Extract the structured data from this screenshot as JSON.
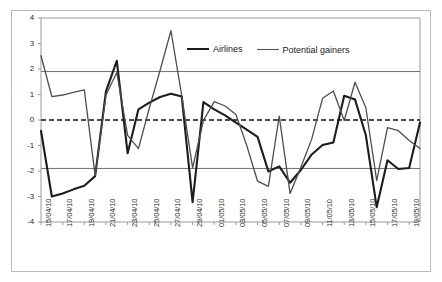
{
  "chart_data": {
    "type": "line",
    "title": "",
    "xlabel": "",
    "ylabel": "",
    "ylim": [
      -4,
      4
    ],
    "yticks": [
      4,
      3,
      2,
      1,
      0,
      -1,
      -2,
      -3,
      -4
    ],
    "grid": "horizontal gridlines at y = 1.9 and y = -1.9 plus frame top at 4; dashed zero reference line at y = 0",
    "gridlines": [
      1.9,
      -1.9
    ],
    "zero_line": 0,
    "legend_position": "top-center",
    "x": [
      "15/04/10",
      "16/04/10",
      "17/04/10",
      "18/04/10",
      "19/04/10",
      "20/04/10",
      "21/04/10",
      "22/04/10",
      "23/04/10",
      "24/04/10",
      "25/04/10",
      "26/04/10",
      "27/04/10",
      "28/04/10",
      "29/04/10",
      "30/04/10",
      "01/05/10",
      "02/05/10",
      "03/05/10",
      "04/05/10",
      "05/05/10",
      "06/05/10",
      "07/05/10",
      "08/05/10",
      "09/05/10",
      "10/05/10",
      "11/05/10",
      "12/05/10",
      "13/05/10",
      "14/05/10",
      "15/05/10",
      "16/05/10",
      "17/05/10",
      "18/05/10",
      "19/05/10",
      "20/05/10"
    ],
    "xtick_labels": [
      "15/04/10",
      "17/04/10",
      "19/04/10",
      "21/04/10",
      "23/04/10",
      "25/04/10",
      "27/04/10",
      "29/04/10",
      "01/05/10",
      "03/05/10",
      "05/05/10",
      "07/05/10",
      "09/05/10",
      "11/05/10",
      "13/05/10",
      "15/05/10",
      "17/05/10",
      "19/05/10"
    ],
    "xtick_indices": [
      0,
      2,
      4,
      6,
      8,
      10,
      12,
      14,
      16,
      18,
      20,
      22,
      24,
      26,
      28,
      30,
      32,
      34
    ],
    "series": [
      {
        "name": "Airlines",
        "color": "#1c1c1c",
        "width": 2.1,
        "values": [
          -0.42,
          -3.0,
          -2.88,
          -2.72,
          -2.58,
          -2.2,
          1.12,
          2.32,
          -1.3,
          0.42,
          0.68,
          0.9,
          1.03,
          0.92,
          -3.22,
          0.7,
          0.42,
          0.18,
          -0.1,
          -0.38,
          -0.66,
          -2.02,
          -1.82,
          -2.46,
          -1.96,
          -1.35,
          -0.98,
          -0.88,
          0.95,
          0.8,
          -0.6,
          -3.42,
          -1.58,
          -1.92,
          -1.88,
          -0.1
        ]
      },
      {
        "name": "Potential gainers",
        "color": "#4d4d4d",
        "width": 1.3,
        "values": [
          2.52,
          0.92,
          0.98,
          1.08,
          1.18,
          -2.18,
          0.98,
          1.86,
          -0.6,
          -1.12,
          0.46,
          1.95,
          3.5,
          0.95,
          -1.88,
          -0.02,
          0.72,
          0.55,
          0.22,
          -1.0,
          -2.4,
          -2.6,
          0.15,
          -2.88,
          -1.85,
          -0.75,
          0.85,
          1.14,
          -0.02,
          1.48,
          0.48,
          -2.38,
          -0.3,
          -0.42,
          -0.8,
          -1.12
        ]
      }
    ]
  },
  "legend": {
    "entries": [
      {
        "label": "Airlines"
      },
      {
        "label": "Potential gainers"
      }
    ]
  }
}
